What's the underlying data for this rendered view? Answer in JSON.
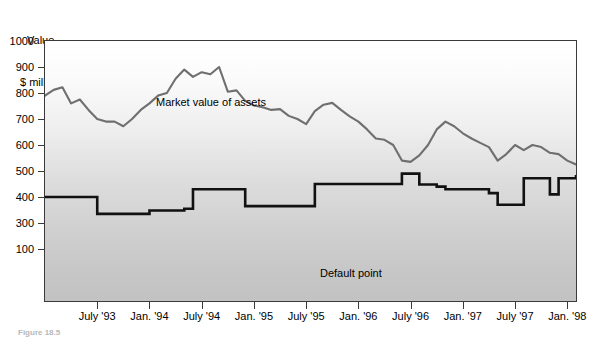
{
  "figure": {
    "axis_title_line1": "Value,",
    "axis_title_line2": "$ millions",
    "caption": "Figure 18.5"
  },
  "annotations": {
    "market_label": "Market value of assets",
    "default_label": "Default point"
  },
  "colors": {
    "market_line": "#6f6f6f",
    "default_line": "#111111",
    "frame": "#3a3a3a",
    "plot_bg_top": "#ffffff",
    "plot_bg_bottom": "#c2c2c2",
    "text": "#000000"
  },
  "chart_data": {
    "type": "line",
    "title": "",
    "xlabel": "",
    "ylabel": "Value, $ millions",
    "ylim": [
      0,
      1000
    ],
    "xlim": [
      0,
      55
    ],
    "grid": false,
    "legend": "inline-annotation",
    "y_ticks": [
      1000,
      900,
      800,
      700,
      600,
      500,
      400,
      300,
      100
    ],
    "x_ticks": [
      "July '93",
      "Jan. '94",
      "July '94",
      "Jan. '95",
      "July '95",
      "Jan. '96",
      "July '96",
      "Jan. '97",
      "July '97",
      "Jan. '98"
    ],
    "x_tick_positions": [
      6,
      12,
      18,
      24,
      30,
      36,
      42,
      48,
      54,
      60
    ],
    "x_index_range": [
      0,
      61
    ],
    "series": [
      {
        "name": "Market value of assets",
        "color": "#6f6f6f",
        "values": [
          790,
          812,
          822,
          760,
          775,
          735,
          700,
          690,
          690,
          672,
          700,
          735,
          760,
          790,
          800,
          855,
          890,
          862,
          880,
          872,
          900,
          805,
          810,
          770,
          752,
          745,
          735,
          738,
          712,
          700,
          680,
          730,
          755,
          762,
          735,
          710,
          690,
          660,
          625,
          620,
          600,
          540,
          535,
          560,
          600,
          660,
          690,
          672,
          645,
          625,
          608,
          592,
          540,
          565,
          600,
          580,
          600,
          592,
          570,
          565,
          540,
          525
        ]
      },
      {
        "name": "Default point",
        "color": "#111111",
        "values": [
          400,
          400,
          400,
          400,
          400,
          400,
          335,
          335,
          335,
          335,
          335,
          335,
          348,
          348,
          348,
          348,
          355,
          430,
          430,
          430,
          430,
          430,
          430,
          365,
          365,
          365,
          365,
          365,
          365,
          365,
          365,
          450,
          450,
          450,
          450,
          450,
          450,
          450,
          450,
          450,
          450,
          490,
          490,
          448,
          448,
          440,
          430,
          430,
          430,
          430,
          430,
          415,
          370,
          370,
          370,
          472,
          472,
          472,
          410,
          472,
          472,
          485
        ]
      }
    ]
  }
}
